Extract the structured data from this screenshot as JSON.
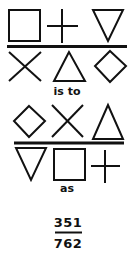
{
  "puzzle": {
    "analogy_top": {
      "numerator_row": [
        "square",
        "plus",
        "inverted-triangle"
      ],
      "denominator_row": [
        "cross",
        "triangle",
        "diamond"
      ]
    },
    "connector_1": "is to",
    "analogy_bottom": {
      "numerator_row": [
        "diamond",
        "cross",
        "triangle"
      ],
      "denominator_row": [
        "inverted-triangle",
        "square",
        "plus"
      ]
    },
    "connector_2": "as",
    "fraction": {
      "numerator": "351",
      "denominator": "762"
    }
  },
  "colors": {
    "stroke": "#111111",
    "background": "#ffffff"
  }
}
